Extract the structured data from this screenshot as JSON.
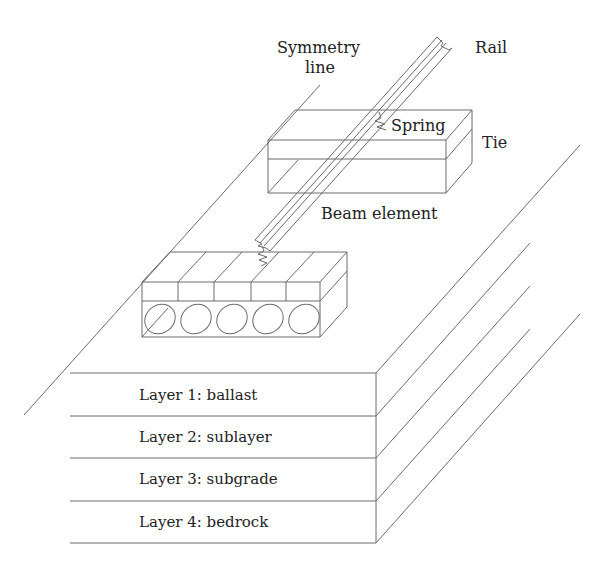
{
  "figure": {
    "type": "isometric track-foundation model",
    "labels": {
      "symmetry_line_1": "Symmetry",
      "symmetry_line_2": "line",
      "rail": "Rail",
      "spring": "Spring",
      "tie": "Tie",
      "beam_element": "Beam element"
    },
    "layers": [
      {
        "label": "Layer 1: ballast"
      },
      {
        "label": "Layer 2: sublayer"
      },
      {
        "label": "Layer 3: subgrade"
      },
      {
        "label": "Layer 4: bedrock"
      }
    ],
    "colors": {
      "line": "#6b6b6b",
      "text": "#222222",
      "background": "#ffffff"
    }
  }
}
